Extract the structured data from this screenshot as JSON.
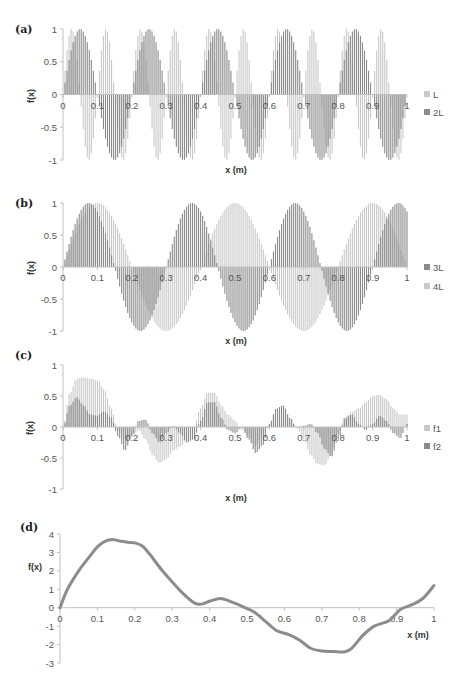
{
  "colors": {
    "light_series": "#c8c8c8",
    "dark_series": "#8a8a8a",
    "line_series": "#8c8c8c",
    "axis": "#c0c0c0",
    "text": "#555555"
  },
  "chart_data": [
    {
      "panel": "(a)",
      "type": "bar",
      "xlabel": "x (m)",
      "ylabel": "f(x)",
      "xlim": [
        0,
        1
      ],
      "ylim": [
        -1,
        1
      ],
      "x_ticks": [
        "0",
        "0.1",
        "0.2",
        "0.3",
        "0.4",
        "0.5",
        "0.6",
        "0.7",
        "0.8",
        "0.9",
        "1"
      ],
      "y_ticks": [
        "1",
        "0.5",
        "0",
        "-0.5",
        "-1"
      ],
      "grid": false,
      "legend_position": "right",
      "series": [
        {
          "name": "L",
          "function": "sin(2*pi*x/0.1)",
          "period": 0.1,
          "amplitude": 1,
          "shade": "light"
        },
        {
          "name": "2L",
          "function": "sin(2*pi*x/0.2)",
          "period": 0.2,
          "amplitude": 1,
          "shade": "dark"
        }
      ]
    },
    {
      "panel": "(b)",
      "type": "bar",
      "xlabel": "x (m)",
      "ylabel": "f(x)",
      "xlim": [
        0,
        1
      ],
      "ylim": [
        -1,
        1
      ],
      "x_ticks": [
        "0",
        "0.1",
        "0.2",
        "0.3",
        "0.4",
        "0.5",
        "0.6",
        "0.7",
        "0.8",
        "0.9",
        "1"
      ],
      "y_ticks": [
        "1",
        "0.5",
        "0",
        "-0.5",
        "-1"
      ],
      "grid": false,
      "legend_position": "right",
      "series": [
        {
          "name": "3L",
          "function": "sin(2*pi*x/0.3)",
          "period": 0.3,
          "amplitude": 1,
          "shade": "dark"
        },
        {
          "name": "4L",
          "function": "sin(2*pi*x/0.4)",
          "period": 0.4,
          "amplitude": 1,
          "shade": "light"
        }
      ]
    },
    {
      "panel": "(c)",
      "type": "bar",
      "xlabel": "x (m)",
      "ylabel": "f(x)",
      "xlim": [
        0,
        1
      ],
      "ylim": [
        -1,
        1
      ],
      "x_ticks": [
        "0",
        "0.1",
        "0.2",
        "0.3",
        "0.4",
        "0.5",
        "0.6",
        "0.7",
        "0.8",
        "0.9",
        "1"
      ],
      "y_ticks": [
        "1",
        "0.5",
        "0",
        "-0.5",
        "-1"
      ],
      "grid": false,
      "legend_position": "right",
      "x": [
        0,
        0.02,
        0.04,
        0.06,
        0.08,
        0.1,
        0.12,
        0.14,
        0.16,
        0.18,
        0.2,
        0.22,
        0.24,
        0.26,
        0.28,
        0.3,
        0.32,
        0.34,
        0.36,
        0.38,
        0.4,
        0.42,
        0.44,
        0.46,
        0.48,
        0.5,
        0.52,
        0.54,
        0.56,
        0.58,
        0.6,
        0.62,
        0.64,
        0.66,
        0.68,
        0.7,
        0.72,
        0.74,
        0.76,
        0.78,
        0.8,
        0.82,
        0.84,
        0.86,
        0.88,
        0.9,
        0.92,
        0.94,
        0.96,
        0.98,
        1.0
      ],
      "series": [
        {
          "name": "f1",
          "shade": "light",
          "values": [
            0,
            0.55,
            0.78,
            0.8,
            0.78,
            0.75,
            0.6,
            0.3,
            -0.05,
            -0.2,
            -0.15,
            -0.05,
            -0.2,
            -0.45,
            -0.58,
            -0.52,
            -0.38,
            -0.32,
            -0.2,
            0.0,
            0.3,
            0.55,
            0.55,
            0.35,
            0.2,
            0.1,
            -0.05,
            -0.15,
            -0.3,
            -0.15,
            0.05,
            0.15,
            0.2,
            0.1,
            0.0,
            -0.2,
            -0.45,
            -0.6,
            -0.62,
            -0.45,
            -0.1,
            0.15,
            0.25,
            0.3,
            0.4,
            0.5,
            0.52,
            0.45,
            0.3,
            0.2,
            0.2
          ]
        },
        {
          "name": "f2",
          "shade": "dark",
          "values": [
            0,
            0.35,
            0.48,
            0.35,
            0.2,
            0.18,
            0.25,
            0.15,
            -0.15,
            -0.38,
            -0.15,
            0.1,
            0.12,
            -0.1,
            -0.25,
            -0.1,
            0.02,
            -0.1,
            -0.25,
            -0.2,
            0.1,
            0.4,
            0.4,
            0.15,
            -0.05,
            -0.1,
            0.0,
            -0.2,
            -0.42,
            -0.3,
            0.05,
            0.3,
            0.35,
            0.15,
            -0.02,
            0.02,
            0.05,
            -0.1,
            -0.35,
            -0.48,
            -0.2,
            0.15,
            0.2,
            0.05,
            -0.05,
            0.05,
            0.18,
            0.1,
            -0.1,
            -0.18,
            0.05
          ]
        }
      ]
    },
    {
      "panel": "(d)",
      "type": "line",
      "xlabel": "x (m)",
      "ylabel": "f(x)",
      "xlim": [
        0,
        1
      ],
      "ylim": [
        -3,
        4
      ],
      "x_ticks": [
        "0",
        "0.1",
        "0.2",
        "0.3",
        "0.4",
        "0.5",
        "0.6",
        "0.7",
        "0.8",
        "0.9",
        "1"
      ],
      "y_ticks": [
        "4",
        "3",
        "2",
        "1",
        "0",
        "-1",
        "-2",
        "-3"
      ],
      "grid": false,
      "legend_position": "none",
      "series": [
        {
          "name": "f(x)",
          "x": [
            0,
            0.02,
            0.05,
            0.08,
            0.1,
            0.12,
            0.14,
            0.16,
            0.18,
            0.2,
            0.22,
            0.24,
            0.27,
            0.3,
            0.33,
            0.36,
            0.38,
            0.4,
            0.43,
            0.46,
            0.49,
            0.52,
            0.55,
            0.58,
            0.61,
            0.64,
            0.67,
            0.7,
            0.73,
            0.76,
            0.78,
            0.81,
            0.84,
            0.88,
            0.91,
            0.94,
            0.97,
            1.0
          ],
          "values": [
            0,
            1.0,
            2.0,
            2.8,
            3.3,
            3.6,
            3.7,
            3.62,
            3.55,
            3.52,
            3.35,
            2.9,
            2.1,
            1.4,
            0.75,
            0.25,
            0.2,
            0.35,
            0.5,
            0.3,
            0.05,
            -0.25,
            -0.75,
            -1.25,
            -1.45,
            -1.75,
            -2.2,
            -2.35,
            -2.38,
            -2.4,
            -2.2,
            -1.5,
            -1.0,
            -0.7,
            -0.1,
            0.15,
            0.5,
            1.2
          ]
        }
      ]
    }
  ]
}
